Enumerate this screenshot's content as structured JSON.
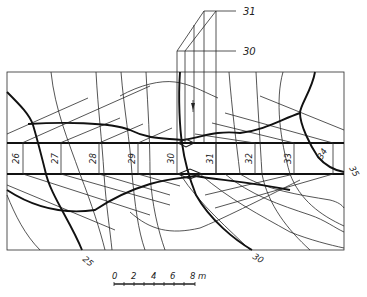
{
  "diagram": {
    "type": "contour plan with excavation strip (station profile)",
    "callouts": [
      {
        "label": "31",
        "x": 243,
        "y": 13
      },
      {
        "label": "30",
        "x": 243,
        "y": 53
      }
    ],
    "stations": [
      {
        "label": "26",
        "x": 15
      },
      {
        "label": "27",
        "x": 55
      },
      {
        "label": "28",
        "x": 92
      },
      {
        "label": "29",
        "x": 131
      },
      {
        "label": "30",
        "x": 170
      },
      {
        "label": "31",
        "x": 208
      },
      {
        "label": "32",
        "x": 248
      },
      {
        "label": "33",
        "x": 287
      },
      {
        "label": "34",
        "x": 325
      }
    ],
    "contour_labels": [
      {
        "label": "25",
        "x": 85,
        "y": 262,
        "rotate": 40
      },
      {
        "label": "30",
        "x": 255,
        "y": 260,
        "rotate": 30
      },
      {
        "label": "35",
        "x": 348,
        "y": 172,
        "rotate": 60
      }
    ],
    "scale_bar": {
      "ticks": [
        "0",
        "2",
        "4",
        "6",
        "8"
      ],
      "unit": "m"
    },
    "colors": {
      "line": "#222222",
      "background": "#ffffff"
    }
  }
}
